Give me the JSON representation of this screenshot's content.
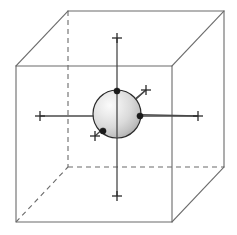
{
  "figure": {
    "caption": "",
    "background_color": "#ffffff",
    "canvas": {
      "width": 237,
      "height": 235
    }
  },
  "cube": {
    "label": "bounding-cube",
    "projection": "oblique-parallel",
    "edge_color_visible": "#6b6b6b",
    "edge_color_hidden": "#6b6b6b",
    "hidden_edge_style": "dashed",
    "stroke_width": 1.1,
    "front_face": {
      "top_left": [
        16,
        66
      ],
      "top_right": [
        172,
        66
      ],
      "bottom_right": [
        172,
        222
      ],
      "bottom_left": [
        16,
        222
      ]
    },
    "back_face": {
      "top_left": [
        68,
        11
      ],
      "top_right": [
        224,
        11
      ],
      "bottom_right": [
        224,
        167
      ],
      "bottom_left": [
        68,
        167
      ]
    },
    "depth_offset": [
      52,
      -55
    ],
    "visible_edges": [
      "front-top",
      "front-right",
      "front-bottom",
      "front-left",
      "back-top",
      "back-right",
      "back-bottom-right-partial",
      "connector-top-left",
      "connector-top-right",
      "connector-bottom-right"
    ],
    "hidden_edges": [
      "back-left-vertical",
      "back-bottom-horizontal",
      "connector-bottom-left"
    ]
  },
  "sphere": {
    "label": "central-sphere",
    "center": [
      117,
      114
    ],
    "radius": 24,
    "outline_color": "#2b2b2b",
    "fill_style": "radial-gradient",
    "highlight_color": "#f2f2f2",
    "mid_color": "#d4d4d4",
    "shadow_color": "#9a9a9a",
    "highlight_position": [
      0.3,
      0.3
    ]
  },
  "axes": [
    {
      "name": "vertical-axis",
      "orientation": "vertical",
      "start": [
        117,
        38
      ],
      "end": [
        117,
        196
      ],
      "color": "#4a4a4a",
      "tick_marks": [
        "start",
        "end"
      ]
    },
    {
      "name": "horizontal-axis",
      "orientation": "horizontal",
      "start": [
        40,
        116
      ],
      "end": [
        198,
        116
      ],
      "color": "#4a4a4a",
      "tick_marks": [
        "start",
        "end"
      ]
    },
    {
      "name": "diagonal-axis",
      "orientation": "diagonal-depth",
      "start": [
        95,
        136
      ],
      "end": [
        146,
        90
      ],
      "color": "#4a4a4a",
      "tick_marks": [
        "start",
        "end"
      ]
    }
  ],
  "tick_marks": [
    {
      "name": "tick-vertical-top",
      "position": [
        117,
        38
      ],
      "style": "cross",
      "size": 5
    },
    {
      "name": "tick-vertical-bottom",
      "position": [
        117,
        196
      ],
      "style": "cross",
      "size": 5
    },
    {
      "name": "tick-horizontal-left",
      "position": [
        40,
        116
      ],
      "style": "cross",
      "size": 5
    },
    {
      "name": "tick-horizontal-right",
      "position": [
        198,
        116
      ],
      "style": "cross",
      "size": 5
    },
    {
      "name": "tick-diagonal-upper",
      "position": [
        146,
        90
      ],
      "style": "cross",
      "size": 5
    },
    {
      "name": "tick-diagonal-lower",
      "position": [
        95,
        136
      ],
      "style": "cross",
      "size": 5
    }
  ],
  "surface_points": [
    {
      "name": "point-top",
      "position": [
        117,
        91
      ],
      "radius": 3.1,
      "color": "#1a1a1a"
    },
    {
      "name": "point-right",
      "position": [
        140,
        116
      ],
      "radius": 3.1,
      "color": "#1a1a1a"
    },
    {
      "name": "point-lower-left",
      "position": [
        103,
        131
      ],
      "radius": 3.1,
      "color": "#1a1a1a"
    }
  ]
}
